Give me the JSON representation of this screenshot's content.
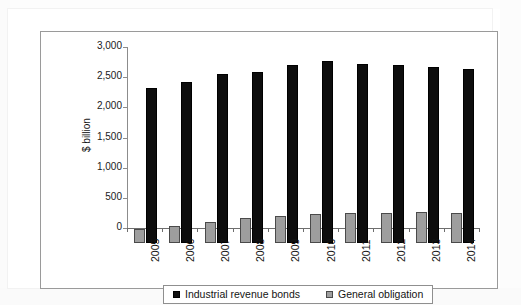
{
  "figure": {
    "edge_text_fragment": "t"
  },
  "chart_data": {
    "type": "bar",
    "title": "",
    "subtitle": "",
    "xlabel": "",
    "ylabel": "$ billion",
    "ylim": [
      0,
      3000
    ],
    "ytick_labels": [
      "0",
      "500",
      "1,000",
      "1,500",
      "2,000",
      "2,500",
      "3,000"
    ],
    "ytick_values": [
      0,
      500,
      1000,
      1500,
      2000,
      2500,
      3000
    ],
    "grid": false,
    "legend_position": "bottom",
    "categories": [
      "2005",
      "2006",
      "2007",
      "2008",
      "2009",
      "2010",
      "2011",
      "2012",
      "2013",
      "2014"
    ],
    "series": [
      {
        "name": "Industrial revenue bonds",
        "color": "#111111",
        "values": [
          2570,
          2670,
          2800,
          2840,
          2950,
          3020,
          2960,
          2950,
          2910,
          2890
        ]
      },
      {
        "name": "General obligation",
        "color": "#9e9e9e",
        "values": [
          230,
          275,
          345,
          410,
          450,
          480,
          490,
          500,
          510,
          505
        ]
      }
    ]
  }
}
